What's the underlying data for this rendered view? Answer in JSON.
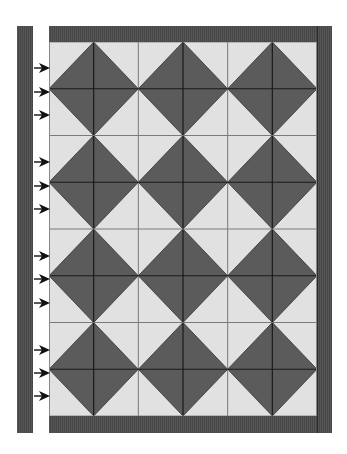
{
  "diagram": {
    "colors": {
      "border": "#4b4b4b",
      "light_tile": "#e1e1e1",
      "dark_tile": "#5b5b5b",
      "grid_line_light": "#7a7a7a",
      "grid_line_dark": "#1a1a1a",
      "arrow": "#111111"
    },
    "grid": {
      "columns": 6,
      "rows": 8,
      "diamond_centers_cols": [
        1,
        3,
        5
      ],
      "diamond_centers_rows": [
        1,
        3,
        5,
        7
      ]
    },
    "arrows_y": [
      65,
      89,
      112,
      159,
      183,
      206,
      253,
      276,
      300,
      347,
      370,
      393
    ]
  }
}
